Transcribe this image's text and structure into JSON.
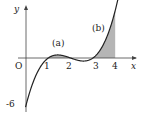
{
  "figure": {
    "function": "y = (x-1)(x-2)(x-3)",
    "axes": {
      "x_label": "x",
      "y_label": "y",
      "origin_label": "O"
    },
    "x_ticks": [
      "1",
      "2",
      "3",
      "4"
    ],
    "y_ticks": [
      "-6"
    ],
    "regions": [
      {
        "label": "(a)",
        "from": 1,
        "to": 2
      },
      {
        "label": "(b)",
        "from": 3,
        "to": 4
      }
    ],
    "colors": {
      "curve": "#222222",
      "shade": "#b5b5b5",
      "axis": "#444444"
    }
  }
}
